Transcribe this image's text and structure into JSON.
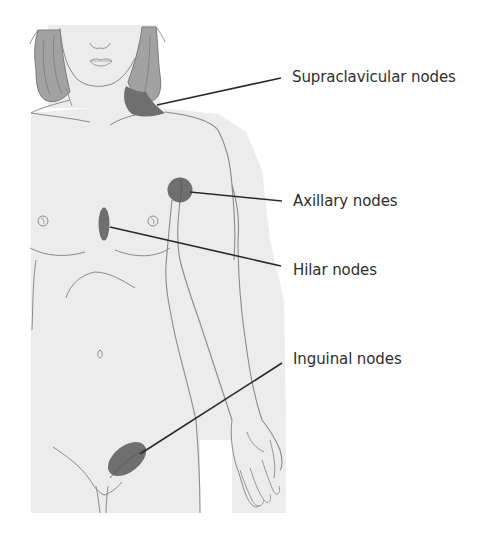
{
  "figure": {
    "colors": {
      "skin": "#ececec",
      "outline": "#8a8a8a",
      "hair": "#a2a2a2",
      "hair_strands": "#6f6f6f",
      "node": "#707070",
      "leader_line": "#2a2a2a",
      "label_text": "#2e2e2e",
      "background": "#ffffff"
    }
  },
  "labels": [
    {
      "id": "supraclavicular",
      "text": "Supraclavicular nodes"
    },
    {
      "id": "axillary",
      "text": "Axillary nodes"
    },
    {
      "id": "hilar",
      "text": "Hilar nodes"
    },
    {
      "id": "inguinal",
      "text": "Inguinal nodes"
    }
  ]
}
